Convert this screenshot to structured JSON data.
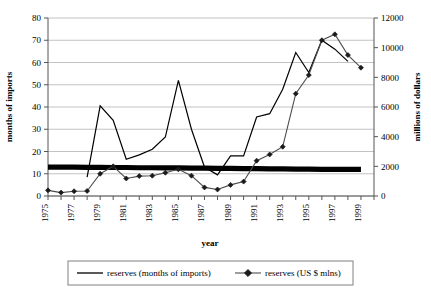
{
  "chart_data": {
    "type": "line",
    "title": "",
    "xlabel": "year",
    "ylabel": "months of imports",
    "y2label": "millions of dollars",
    "grid": true,
    "legend_position": "bottom",
    "xlim": [
      1975,
      2000
    ],
    "ylim": [
      0,
      80
    ],
    "y2lim": [
      0,
      12000
    ],
    "yticks": [
      0,
      10,
      20,
      30,
      40,
      50,
      60,
      70,
      80
    ],
    "y2ticks": [
      0,
      2000,
      4000,
      6000,
      8000,
      10000,
      12000
    ],
    "xticks": [
      1975,
      1977,
      1979,
      1981,
      1983,
      1985,
      1987,
      1989,
      1991,
      1993,
      1995,
      1997,
      1999
    ],
    "x": [
      1975,
      1976,
      1977,
      1978,
      1979,
      1980,
      1981,
      1982,
      1983,
      1984,
      1985,
      1986,
      1987,
      1988,
      1989,
      1990,
      1991,
      1992,
      1993,
      1994,
      1995,
      1996,
      1997,
      1998,
      1999
    ],
    "series": [
      {
        "name": "reserves (months of imports)",
        "axis": "left",
        "marker": "none",
        "linewidth": "thick-flat",
        "color": "#000000",
        "values": [
          13.0,
          13.0,
          13.0,
          12.9,
          12.9,
          12.8,
          12.8,
          12.7,
          12.7,
          12.6,
          12.6,
          12.5,
          12.5,
          12.4,
          12.4,
          12.3,
          12.3,
          12.2,
          12.2,
          12.1,
          12.1,
          12.0,
          12.0,
          12.0,
          12.0
        ]
      },
      {
        "name": "reserves (months of imports) thin",
        "axis": "left",
        "marker": "none",
        "color": "#000000",
        "values": [
          null,
          null,
          null,
          8.5,
          40.5,
          34.0,
          16.5,
          18.5,
          21.0,
          26.5,
          52.0,
          30.0,
          13.0,
          9.5,
          18.0,
          18.0,
          35.5,
          37.0,
          48.0,
          64.5,
          55.5,
          70.0,
          66.0,
          60.5,
          null
        ]
      },
      {
        "name": "reserves (US $ mlns)",
        "axis": "right",
        "marker": "diamond",
        "color": "#4d4d4d",
        "values": [
          380,
          230,
          320,
          340,
          1500,
          2000,
          1180,
          1340,
          1370,
          1570,
          1800,
          1370,
          580,
          440,
          750,
          970,
          2380,
          2800,
          3320,
          6900,
          8150,
          10500,
          10900,
          9500,
          8650
        ]
      }
    ]
  },
  "legend": {
    "items": [
      {
        "label": "reserves (months of imports)",
        "symbol": "line"
      },
      {
        "label": "reserves (US $ mlns)",
        "symbol": "line-diamond"
      }
    ]
  },
  "labels": {
    "y_axis_title": "months of imports",
    "y2_axis_title": "millions of dollars",
    "x_axis_title": "year"
  }
}
